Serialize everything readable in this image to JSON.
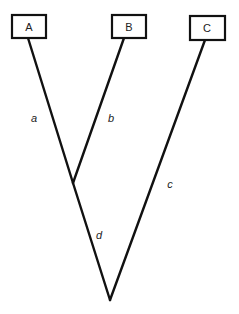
{
  "diagram": {
    "type": "phylogenetic-tree",
    "leaves": [
      {
        "id": "A",
        "label": "A"
      },
      {
        "id": "B",
        "label": "B"
      },
      {
        "id": "C",
        "label": "C"
      }
    ],
    "branches": [
      {
        "id": "a",
        "label": "a",
        "from": "A",
        "to": "AB-node"
      },
      {
        "id": "b",
        "label": "b",
        "from": "B",
        "to": "AB-node"
      },
      {
        "id": "c",
        "label": "c",
        "from": "C",
        "to": "root"
      },
      {
        "id": "d",
        "label": "d",
        "from": "AB-node",
        "to": "root"
      }
    ],
    "colors": {
      "line": "#111111",
      "text": "#222222",
      "background": "#ffffff"
    }
  }
}
